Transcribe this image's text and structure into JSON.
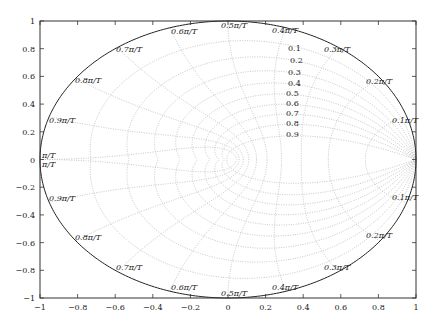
{
  "chart_data": {
    "type": "line",
    "title": "",
    "xlabel": "",
    "ylabel": "",
    "xlim": [
      -1,
      1
    ],
    "ylim": [
      -1,
      1
    ],
    "grid": true,
    "legend": null,
    "x_ticks": [
      "-1",
      "-0.8",
      "-0.6",
      "-0.4",
      "-0.2",
      "0",
      "0.2",
      "0.4",
      "0.6",
      "0.8",
      "1"
    ],
    "y_ticks": [
      "1",
      "0.8",
      "0.6",
      "0.4",
      "0.2",
      "0",
      "-0.2",
      "-0.4",
      "-0.6",
      "-0.8",
      "-1"
    ],
    "damping_ratios": [
      0.1,
      0.2,
      0.3,
      0.4,
      0.5,
      0.6,
      0.7,
      0.8,
      0.9
    ],
    "damping_labels": [
      "0.1",
      "0.2",
      "0.3",
      "0.4",
      "0.5",
      "0.6",
      "0.7",
      "0.8",
      "0.9"
    ],
    "natural_frequencies": [
      0.1,
      0.2,
      0.3,
      0.4,
      0.5,
      0.6,
      0.7,
      0.8,
      0.9,
      1.0
    ],
    "frequency_labels_upper": [
      "0.1π/T",
      "0.2π/T",
      "0.3π/T",
      "0.4π/T",
      "0.5π/T",
      "0.6π/T",
      "0.7π/T",
      "0.8π/T",
      "0.9π/T",
      "π/T"
    ],
    "frequency_labels_lower": [
      "0.1π/T",
      "0.2π/T",
      "0.3π/T",
      "0.4π/T",
      "0.5π/T",
      "0.6π/T",
      "0.7π/T",
      "0.8π/T",
      "0.9π/T",
      "π/T"
    ],
    "series": [
      {
        "name": "unit circle",
        "style": "solid",
        "color": "#222222"
      },
      {
        "name": "constant damping contours",
        "style": "dotted",
        "color": "#b8b8b8"
      },
      {
        "name": "constant natural frequency contours",
        "style": "dotted",
        "color": "#b8b8b8"
      }
    ]
  },
  "colors": {
    "axis": "#333333",
    "unit_circle": "#222222",
    "grid": "#b8b8b8",
    "text": "#222222",
    "background": "#ffffff"
  }
}
